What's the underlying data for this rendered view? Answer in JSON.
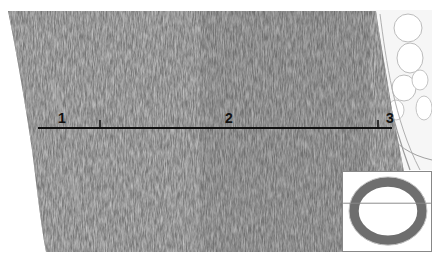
{
  "image": {
    "description": "Histological cross-section of a vessel wall showing layered tissue with a measurement bar and an inset overview of the ring-shaped section",
    "colors": {
      "tissue": "#7a7a7a",
      "tissue_dark": "#555555",
      "tissue_light": "#a8a8a8",
      "adipose": "#f4f4f4",
      "background": "#ffffff",
      "scale_line": "#111111"
    }
  },
  "annotations": {
    "labels": [
      {
        "id": "1",
        "text": "1"
      },
      {
        "id": "2",
        "text": "2"
      },
      {
        "id": "3",
        "text": "3"
      }
    ]
  },
  "inset": {
    "description": "Low-magnification overview of ring-shaped vessel cross-section with horizontal guide line"
  }
}
